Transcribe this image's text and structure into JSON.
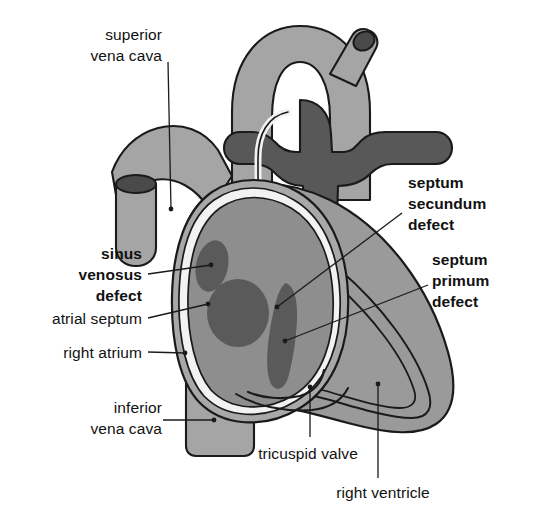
{
  "figure": {
    "background_color": "#ffffff",
    "outline_color": "#1a1a1a",
    "colors": {
      "myocardium_light": "#a8a8a8",
      "myocardium_mid": "#9a9a9a",
      "chamber_fill": "#8e8e8e",
      "chamber_fill_dark": "#848484",
      "vessel_light": "#a5a5a5",
      "vessel_dark": "#585858",
      "defect_dark": "#5a5a5a",
      "lumen_dark": "#4a4a4a",
      "endocardium_pale": "#f2f2f2"
    }
  },
  "labels": [
    {
      "id": "superior-vena-cava",
      "lines": [
        "superior",
        "vena cava"
      ],
      "bold": false,
      "align": "right",
      "x": 40,
      "y": 24,
      "width": 122,
      "leader": {
        "x1": 168,
        "y1": 62,
        "x2": 171,
        "y2": 209
      }
    },
    {
      "id": "sinus-venosus-defect",
      "lines": [
        "sinus",
        "venosus",
        "defect"
      ],
      "bold": true,
      "align": "right",
      "x": 24,
      "y": 243,
      "width": 118,
      "leader": {
        "x1": 148,
        "y1": 274,
        "x2": 211,
        "y2": 265
      }
    },
    {
      "id": "atrial-septum",
      "lines": [
        "atrial septum"
      ],
      "bold": false,
      "align": "right",
      "x": 16,
      "y": 308,
      "width": 126,
      "leader": {
        "x1": 148,
        "y1": 318,
        "x2": 208,
        "y2": 304
      }
    },
    {
      "id": "right-atrium",
      "lines": [
        "right atrium"
      ],
      "bold": false,
      "align": "right",
      "x": 20,
      "y": 342,
      "width": 122,
      "leader": {
        "x1": 148,
        "y1": 352,
        "x2": 185,
        "y2": 353
      }
    },
    {
      "id": "inferior-vena-cava",
      "lines": [
        "inferior",
        "vena cava"
      ],
      "bold": false,
      "align": "right",
      "x": 40,
      "y": 397,
      "width": 122,
      "leader": {
        "x1": 163,
        "y1": 420,
        "x2": 214,
        "y2": 420
      }
    },
    {
      "id": "septum-secundum-defect",
      "lines": [
        "septum",
        "secundum",
        "defect"
      ],
      "bold": true,
      "align": "left",
      "x": 408,
      "y": 172,
      "width": 118,
      "leader": {
        "x1": 402,
        "y1": 213,
        "x2": 277,
        "y2": 307
      }
    },
    {
      "id": "septum-primum-defect",
      "lines": [
        "septum",
        "primum",
        "defect"
      ],
      "bold": true,
      "align": "left",
      "x": 432,
      "y": 249,
      "width": 100,
      "leader": {
        "x1": 428,
        "y1": 285,
        "x2": 285,
        "y2": 341
      }
    },
    {
      "id": "tricuspid-valve",
      "lines": [
        "tricuspid valve"
      ],
      "bold": false,
      "align": "center",
      "x": 246,
      "y": 443,
      "width": 124,
      "leader": {
        "x1": 310,
        "y1": 437,
        "x2": 310,
        "y2": 387
      }
    },
    {
      "id": "right-ventricle",
      "lines": [
        "right ventricle"
      ],
      "bold": false,
      "align": "center",
      "x": 320,
      "y": 482,
      "width": 126,
      "leader": {
        "x1": 378,
        "y1": 478,
        "x2": 378,
        "y2": 384
      }
    }
  ]
}
